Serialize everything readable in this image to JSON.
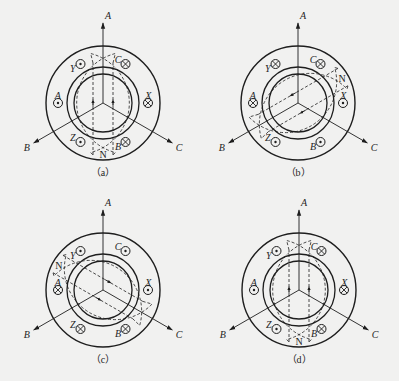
{
  "figure": {
    "colors": {
      "background": "#f1f1f0",
      "line": "#1e1e1e"
    },
    "geometry": {
      "outer_stator_r": 57,
      "stator_bore_r": 36,
      "rotor_outer_r": 33,
      "rotor_inner_r": 29,
      "slot_r": 45,
      "coil_r": 4.5,
      "axis_len": 80
    },
    "axes": [
      {
        "label": "A",
        "angle": 90
      },
      {
        "label": "B",
        "angle": 210
      },
      {
        "label": "C",
        "angle": 330
      }
    ],
    "panels": [
      {
        "id": "a",
        "caption": "（a）",
        "cx": 103,
        "cy": 103,
        "coils": [
          {
            "label": "Y",
            "angle": 120,
            "current": "out"
          },
          {
            "label": "C",
            "angle": 60,
            "current": "in"
          },
          {
            "label": "A",
            "angle": 180,
            "current": "out"
          },
          {
            "label": "X",
            "angle": 0,
            "current": "in"
          },
          {
            "label": "Z",
            "angle": 240,
            "current": "out"
          },
          {
            "label": "B",
            "angle": 300,
            "current": "in"
          }
        ],
        "flux_angle": 90,
        "pole": {
          "label": "N",
          "angle": 270
        }
      },
      {
        "id": "b",
        "caption": "（b）",
        "cx": 298,
        "cy": 103,
        "coils": [
          {
            "label": "Y",
            "angle": 120,
            "current": "in"
          },
          {
            "label": "C",
            "angle": 60,
            "current": "in"
          },
          {
            "label": "A",
            "angle": 180,
            "current": "in"
          },
          {
            "label": "X",
            "angle": 0,
            "current": "out"
          },
          {
            "label": "Z",
            "angle": 240,
            "current": "out"
          },
          {
            "label": "B",
            "angle": 300,
            "current": "out"
          }
        ],
        "flux_angle": 210,
        "pole": {
          "label": "N",
          "angle": 30
        }
      },
      {
        "id": "c",
        "caption": "（c）",
        "cx": 103,
        "cy": 290,
        "coils": [
          {
            "label": "Y",
            "angle": 120,
            "current": "out"
          },
          {
            "label": "C",
            "angle": 60,
            "current": "out"
          },
          {
            "label": "A",
            "angle": 180,
            "current": "in"
          },
          {
            "label": "X",
            "angle": 0,
            "current": "out"
          },
          {
            "label": "Z",
            "angle": 240,
            "current": "in"
          },
          {
            "label": "B",
            "angle": 300,
            "current": "in"
          }
        ],
        "flux_angle": 330,
        "pole": {
          "label": "N",
          "angle": 150
        }
      },
      {
        "id": "d",
        "caption": "（d）",
        "cx": 299,
        "cy": 290,
        "coils": [
          {
            "label": "Y",
            "angle": 120,
            "current": "out"
          },
          {
            "label": "C",
            "angle": 60,
            "current": "in"
          },
          {
            "label": "A",
            "angle": 180,
            "current": "out"
          },
          {
            "label": "X",
            "angle": 0,
            "current": "in"
          },
          {
            "label": "Z",
            "angle": 240,
            "current": "out"
          },
          {
            "label": "B",
            "angle": 300,
            "current": "in"
          }
        ],
        "flux_angle": 90,
        "pole": {
          "label": "N",
          "angle": 270
        }
      }
    ]
  }
}
